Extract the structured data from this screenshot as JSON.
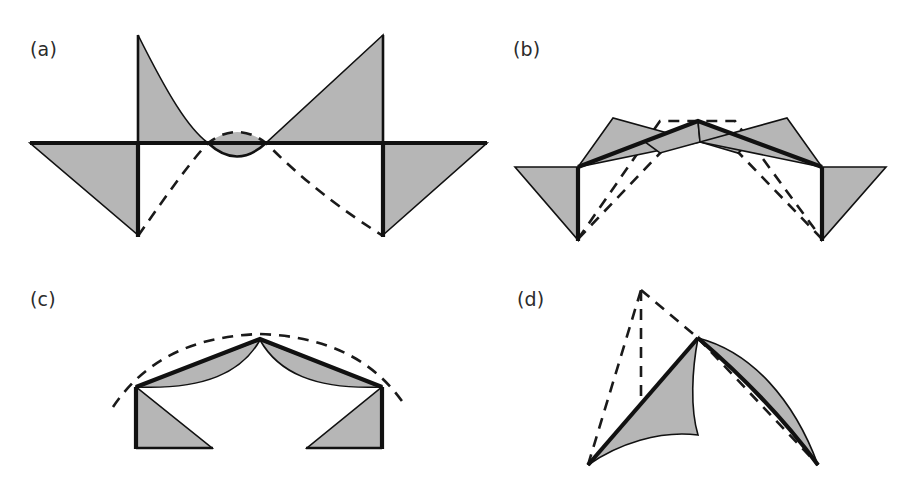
{
  "figure": {
    "width": 908,
    "height": 494,
    "background_color": "#ffffff",
    "ink_color": "#111111",
    "shade_color": "#b6b6b6",
    "caption_note": "Four-panel line drawing of curve/offset constructions with shaded triangular and lens-shaped regions; each panel marked by a parenthesized letter label."
  },
  "panels": [
    {
      "id": "a",
      "label": "(a)",
      "label_x": 30,
      "label_y": 56,
      "description": "Horizontal baseline with two downward vertical segments; four shaded triangles (two above, two below) arranged in bow-tie pattern, plus a dashed parabola-like curve dipping below the baseline and a small lens shape at the center.",
      "elements": [
        "baseline-horizontal",
        "left-vertical-drop",
        "right-vertical-drop",
        "upper-left-triangle",
        "upper-right-triangle",
        "lower-left-triangle",
        "lower-right-triangle",
        "center-lens",
        "dashed-curve"
      ]
    },
    {
      "id": "b",
      "label": "(b)",
      "label_x": 513,
      "label_y": 56,
      "description": "Tent-shaped polyline with central apex; four shaded arrow-like triangles fanning outward, two vertical drops at the shoulders, and a dashed polygonal outline tracing an offset tent.",
      "elements": [
        "left-slope-segment",
        "right-slope-segment",
        "apex-vertex",
        "left-vertical-drop",
        "right-vertical-drop",
        "outer-left-triangle",
        "outer-right-triangle",
        "inner-left-triangle",
        "inner-right-triangle",
        "lower-left-triangle",
        "lower-right-triangle",
        "dashed-offset-outline"
      ]
    },
    {
      "id": "c",
      "label": "(c)",
      "label_x": 30,
      "label_y": 306,
      "description": "Tent-shaped polyline with apex; shaded crescent slivers between the straight roof lines and a curved arc beneath them; two shaded right triangles below forming legs; dashed arc offset above the roof.",
      "elements": [
        "left-roof-segment",
        "right-roof-segment",
        "apex-vertex",
        "left-crescent",
        "right-crescent",
        "left-leg-triangle",
        "right-leg-triangle",
        "left-vertical",
        "right-vertical",
        "dashed-offset-arc"
      ]
    },
    {
      "id": "d",
      "label": "(d)",
      "label_x": 517,
      "label_y": 306,
      "description": "Two concave-curved shaded regions meeting at a cusp vertex; a dashed triangular spike rises above and left of the cusp, and a dashed chord runs down to the lower right tip.",
      "elements": [
        "cusp-vertex",
        "left-curved-region",
        "right-curved-crescent",
        "dashed-spike-left",
        "dashed-spike-vertical",
        "dashed-spike-right",
        "dashed-chord-right",
        "lower-left-tip",
        "lower-right-tip"
      ]
    }
  ]
}
